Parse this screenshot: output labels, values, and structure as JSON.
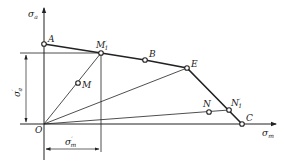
{
  "diagram": {
    "type": "limiting-stress-diagram",
    "axes": {
      "y_label": "σa",
      "y_label_main": "σ",
      "y_label_sub": "a",
      "x_label": "σm",
      "x_label_main": "σ",
      "x_label_sub": "m",
      "origin_label": "O"
    },
    "points": {
      "A": "A",
      "M1_prime": "M'1",
      "M1_prime_main": "M",
      "M1_prime_sup": "′",
      "M1_prime_sub": "1",
      "B": "B",
      "E": "E",
      "C": "C",
      "M": "M",
      "N": "N",
      "N1_prime": "N'1",
      "N1_prime_main": "N",
      "N1_prime_sup": "′",
      "N1_prime_sub": "1"
    },
    "dimensions": {
      "sigma_a_prime": "σ'a",
      "sigma_a_prime_main": "σ",
      "sigma_a_prime_sup": "′",
      "sigma_a_prime_sub": "a",
      "sigma_m_prime": "σ'm",
      "sigma_m_prime_main": "σ",
      "sigma_m_prime_sup": "′",
      "sigma_m_prime_sub": "m"
    },
    "limit_curve": [
      "A",
      "M'1",
      "B",
      "E",
      "C"
    ],
    "rays_from_origin": [
      "M'1 (through M)",
      "E",
      "N'1 (through N)"
    ]
  }
}
